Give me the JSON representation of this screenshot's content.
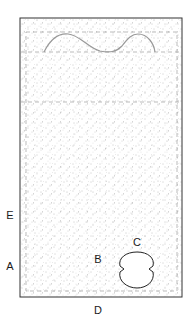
{
  "diagram": {
    "type": "specimen-schematic",
    "labels": {
      "E": "E",
      "A": "A",
      "B": "B",
      "C": "C",
      "D": "D"
    },
    "colors": {
      "outline": "#333333",
      "curve": "#999999",
      "dashed": "#aaaaaa",
      "stipple": "#888888"
    }
  }
}
